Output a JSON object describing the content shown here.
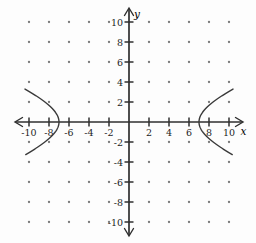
{
  "figure": {
    "background_color": "#fdfdfd"
  },
  "chart_data": {
    "type": "line",
    "curve": "hyperbola",
    "equation": "x^2/49 - y^2/9 = 1",
    "a": 7,
    "b": 3,
    "orientation": "horizontal",
    "center": [
      0,
      0
    ],
    "vertices": [
      [
        -7,
        0
      ],
      [
        7,
        0
      ]
    ],
    "x_draw_limit": 10.4,
    "branch_endpoints": [
      [
        -10.4,
        3.3
      ],
      [
        -10.4,
        -3.3
      ],
      [
        10.4,
        3.3
      ],
      [
        10.4,
        -3.3
      ]
    ],
    "xlabel": "x",
    "ylabel": "y",
    "x_ticks": [
      -10,
      -8,
      -6,
      -4,
      -2,
      2,
      4,
      6,
      8,
      10
    ],
    "y_ticks": [
      10,
      8,
      6,
      4,
      2,
      -2,
      -4,
      -6,
      -8,
      -10
    ],
    "xlim": [
      -11.4,
      11.4
    ],
    "ylim": [
      -11.4,
      11.4
    ],
    "tick_step": 2,
    "grid": "dotted",
    "grid_step": 2,
    "legend": "none",
    "title": "",
    "axis_color": "#2f2f2f",
    "curve_color": "#3a3a3a",
    "dot_color": "#7a7a7a",
    "label_color": "#1d1d1d"
  }
}
